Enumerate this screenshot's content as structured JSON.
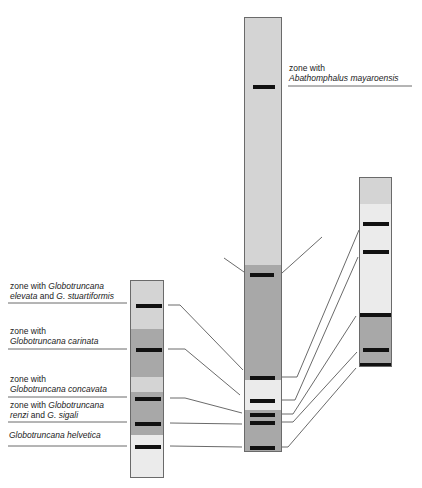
{
  "colors": {
    "light": "#d4d4d4",
    "pale": "#ebebeb",
    "dark": "#a8a8a8",
    "mark": "#111111",
    "line": "#444444"
  },
  "labels": {
    "abathomphalus": {
      "line1": "zone with",
      "line2": "Abathomphalus mayaroensis"
    },
    "elevata": {
      "line1a": "zone with ",
      "line1b": "Globotruncana",
      "line2a": "elevata",
      "line2b": " and ",
      "line2c": "G. stuartiformis"
    },
    "carinata": {
      "line1": "zone with",
      "line2": "Globotruncana carinata"
    },
    "concavata": {
      "line1": "zone with",
      "line2": "Globotruncana concavata"
    },
    "renzi": {
      "line1a": "zone with ",
      "line1b": "Globotruncana",
      "line2a": "renzi",
      "line2b": " and ",
      "line2c": "G. sigali"
    },
    "helvetica": {
      "line1": "Globotruncana helvetica"
    }
  }
}
